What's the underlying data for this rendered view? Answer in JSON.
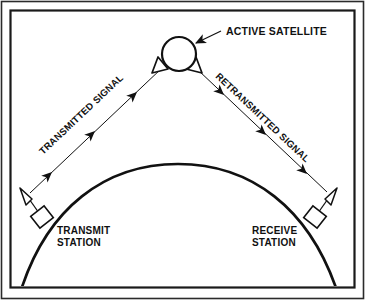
{
  "figure": {
    "type": "technical-diagram",
    "background_color": "#ffffff",
    "ink_color": "#111111",
    "frame": {
      "outer_border_color": "#2b2b2b",
      "inner_border_color": "#1a1a1a"
    }
  },
  "labels": {
    "satellite": "ACTIVE SATELLITE",
    "transmitted_signal": "TRANSMITTED SIGNAL",
    "retransmitted_signal": "RETRANSMITTED SIGNAL",
    "transmit_station_line1": "TRANSMIT",
    "transmit_station_line2": "STATION",
    "receive_station_line1": "RECEIVE",
    "receive_station_line2": "STATION"
  },
  "elements": {
    "satellite_body": "circle",
    "satellite_left_horn": "horn-antenna",
    "satellite_right_horn": "horn-antenna",
    "earth_surface": "arc",
    "transmit_antenna": "horn-antenna",
    "transmit_building": "rectangle",
    "receive_antenna": "horn-antenna",
    "receive_building": "rectangle",
    "uplink_arrow_count": 3,
    "downlink_arrow_count": 3
  }
}
